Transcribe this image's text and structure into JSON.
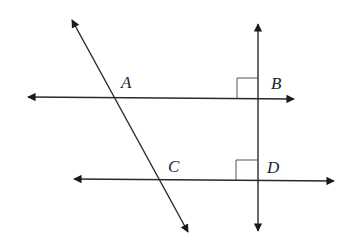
{
  "diagram": {
    "type": "geometry-lines",
    "colors": {
      "line": "#2a2a2a",
      "background": "#ffffff",
      "right_angle_mark": "#555555"
    },
    "points": [
      {
        "label": "A",
        "x": 127,
        "y": 82
      },
      {
        "label": "B",
        "x": 276,
        "y": 83
      },
      {
        "label": "C",
        "x": 174,
        "y": 166
      },
      {
        "label": "D",
        "x": 273,
        "y": 167
      }
    ],
    "lines": [
      {
        "name": "line-AB",
        "x1": 28,
        "y1": 97,
        "x2": 294,
        "y2": 99
      },
      {
        "name": "line-CD",
        "x1": 74,
        "y1": 179,
        "x2": 334,
        "y2": 181
      },
      {
        "name": "vertical-BD",
        "x1": 258,
        "y1": 24,
        "x2": 258,
        "y2": 231
      },
      {
        "name": "transversal-AC",
        "x1": 72,
        "y1": 20,
        "x2": 188,
        "y2": 232
      }
    ],
    "right_angles": [
      {
        "at": "B",
        "x": 258,
        "y": 98
      },
      {
        "at": "D",
        "x": 258,
        "y": 180
      }
    ]
  }
}
